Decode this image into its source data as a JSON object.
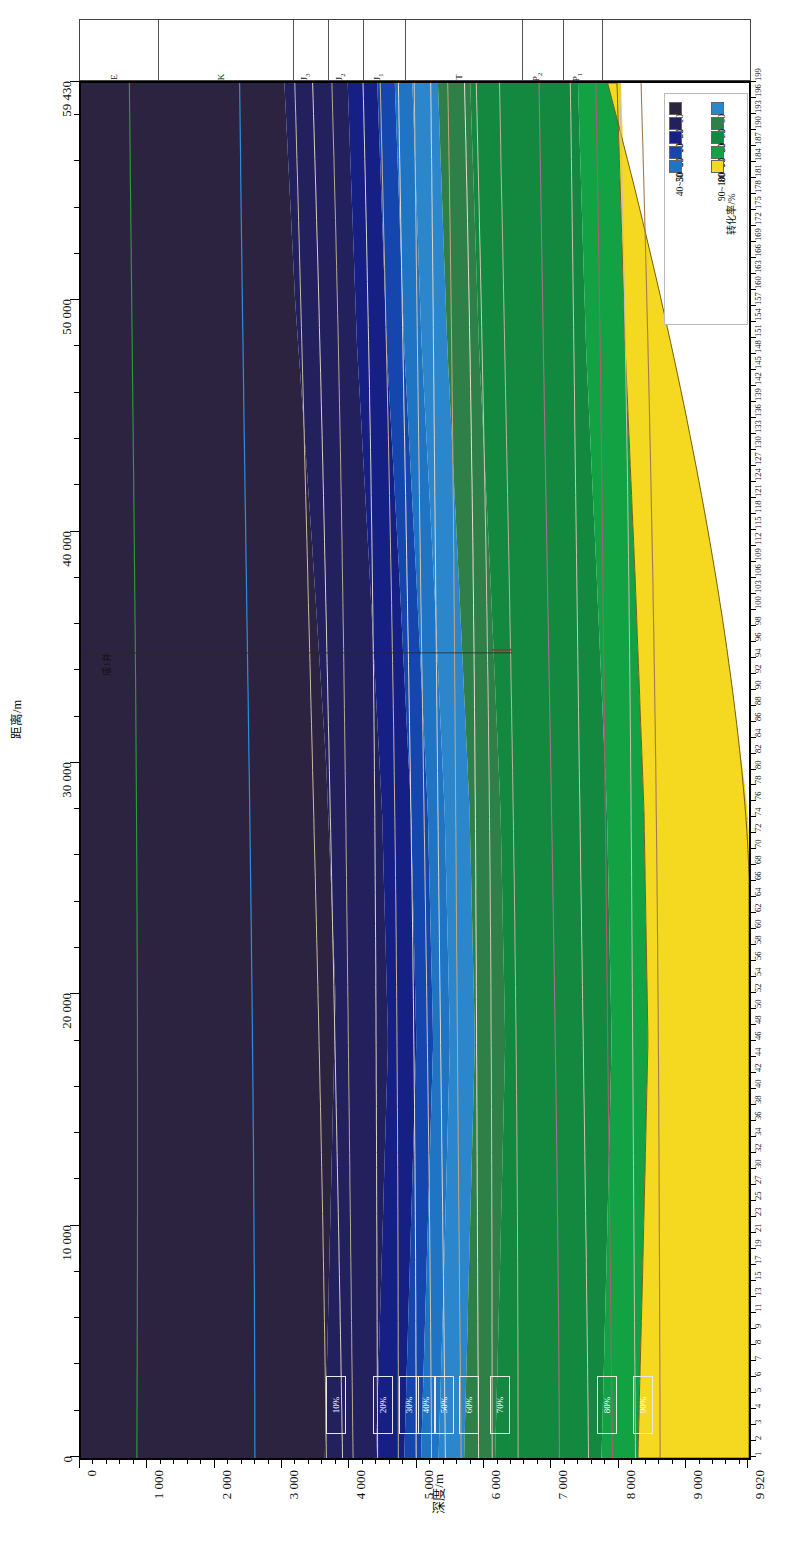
{
  "figure": {
    "type": "geological-cross-section-contour",
    "orientation": "rotated-90-ccw"
  },
  "axes": {
    "distance": {
      "title": "距离/m",
      "unit": "m",
      "min": 0,
      "max": 59430,
      "ticks": [
        {
          "value": 0,
          "label": "0"
        },
        {
          "value": 10000,
          "label": "10 000"
        },
        {
          "value": 20000,
          "label": "20 000"
        },
        {
          "value": 30000,
          "label": "30 000"
        },
        {
          "value": 40000,
          "label": "40 000"
        },
        {
          "value": 50000,
          "label": "50 000"
        },
        {
          "value": 59430,
          "label": "59 430"
        }
      ],
      "minor_step": 2000
    },
    "depth": {
      "title": "深度/m",
      "unit": "m",
      "min": 0,
      "max": 9920,
      "ticks": [
        {
          "value": 0,
          "label": "0"
        },
        {
          "value": 1000,
          "label": "1 000"
        },
        {
          "value": 2000,
          "label": "2 000"
        },
        {
          "value": 3000,
          "label": "3 000"
        },
        {
          "value": 4000,
          "label": "4 000"
        },
        {
          "value": 5000,
          "label": "5 000"
        },
        {
          "value": 6000,
          "label": "6 000"
        },
        {
          "value": 7000,
          "label": "7 000"
        },
        {
          "value": 8000,
          "label": "8 000"
        },
        {
          "value": 9000,
          "label": "9 000"
        },
        {
          "value": 9920,
          "label": "9 920"
        }
      ],
      "minor_step": 200
    },
    "grid_index": {
      "labels": [
        "1",
        "2",
        "3",
        "4",
        "5",
        "6",
        "7",
        "8",
        "9",
        "11",
        "13",
        "15",
        "17",
        "19",
        "21",
        "23",
        "25",
        "27",
        "30",
        "32",
        "34",
        "36",
        "38",
        "40",
        "42",
        "44",
        "46",
        "48",
        "50",
        "52",
        "54",
        "56",
        "58",
        "60",
        "62",
        "64",
        "66",
        "68",
        "70",
        "72",
        "74",
        "76",
        "78",
        "80",
        "82",
        "84",
        "86",
        "88",
        "90",
        "92",
        "94",
        "96",
        "98",
        "100",
        "103",
        "106",
        "109",
        "112",
        "115",
        "118",
        "121",
        "124",
        "127",
        "130",
        "133",
        "136",
        "139",
        "142",
        "145",
        "148",
        "151",
        "154",
        "157",
        "160",
        "163",
        "166",
        "169",
        "172",
        "175",
        "178",
        "181",
        "184",
        "187",
        "190",
        "193",
        "196",
        "199"
      ]
    }
  },
  "strata": {
    "columns": [
      {
        "label": "E",
        "sub": "",
        "width_frac": 0.118
      },
      {
        "label": "K",
        "sub": "",
        "width_frac": 0.202
      },
      {
        "label": "J",
        "sub": "3",
        "width_frac": 0.052
      },
      {
        "label": "J",
        "sub": "2",
        "width_frac": 0.052
      },
      {
        "label": "J",
        "sub": "1",
        "width_frac": 0.062
      },
      {
        "label": "T",
        "sub": "",
        "width_frac": 0.175
      },
      {
        "label": "P",
        "sub": "2",
        "width_frac": 0.062
      },
      {
        "label": "P",
        "sub": "1",
        "width_frac": 0.058
      },
      {
        "label": "",
        "sub": "",
        "width_frac": 0.219
      }
    ]
  },
  "legend": {
    "title": "转化率/%",
    "lower": [
      {
        "label": "0~10",
        "color": "#2b2340"
      },
      {
        "label": "10~20",
        "color": "#22215e"
      },
      {
        "label": "20~30",
        "color": "#151f84"
      },
      {
        "label": "30~40",
        "color": "#1546ad"
      },
      {
        "label": "40~50",
        "color": "#1f74c4"
      }
    ],
    "upper": [
      {
        "label": "50~60",
        "color": "#2b86cc"
      },
      {
        "label": "60~70",
        "color": "#2f7f49"
      },
      {
        "label": "70~80",
        "color": "#12893f"
      },
      {
        "label": "80~90",
        "color": "#12a244"
      },
      {
        "label": "90~100",
        "color": "#f5d820"
      }
    ]
  },
  "contour_labels": [
    {
      "text": "10%",
      "depth": 3740,
      "distance": 2400
    },
    {
      "text": "20%",
      "depth": 4440,
      "distance": 2400
    },
    {
      "text": "30%",
      "depth": 4830,
      "distance": 2400
    },
    {
      "text": "40%",
      "depth": 5080,
      "distance": 2400
    },
    {
      "text": "50%",
      "depth": 5340,
      "distance": 2400
    },
    {
      "text": "60%",
      "depth": 5720,
      "distance": 2400
    },
    {
      "text": "70%",
      "depth": 6180,
      "distance": 2400
    },
    {
      "text": "80%",
      "depth": 7760,
      "distance": 2400
    },
    {
      "text": "90%",
      "depth": 8300,
      "distance": 2400
    }
  ],
  "annotations": [
    {
      "name": "well-label",
      "text": "成1井",
      "depth": 230,
      "distance": 34800
    }
  ],
  "chart_data": {
    "type": "heatmap",
    "title": "",
    "xlabel": "深度/m",
    "ylabel": "距离/m",
    "xlim": [
      0,
      9920
    ],
    "ylim": [
      0,
      59430
    ],
    "grid": false,
    "legend_position": "top-right",
    "legend_title": "转化率/%",
    "bins": [
      "0~10",
      "10~20",
      "20~30",
      "30~40",
      "40~50",
      "50~60",
      "60~70",
      "70~80",
      "80~90",
      "90~100"
    ],
    "bin_colors": [
      "#2b2340",
      "#22215e",
      "#151f84",
      "#1546ad",
      "#1f74c4",
      "#2b86cc",
      "#2f7f49",
      "#12893f",
      "#12a244",
      "#f5d820"
    ],
    "contours": [
      {
        "level": "10%",
        "points": [
          [
            3620,
            0
          ],
          [
            3700,
            10000
          ],
          [
            3780,
            20000
          ],
          [
            3640,
            30000
          ],
          [
            3420,
            40000
          ],
          [
            3180,
            50000
          ],
          [
            3020,
            59430
          ]
        ]
      },
      {
        "level": "20%",
        "points": [
          [
            4380,
            0
          ],
          [
            4460,
            8000
          ],
          [
            4560,
            18000
          ],
          [
            4470,
            28000
          ],
          [
            4290,
            38000
          ],
          [
            4100,
            48000
          ],
          [
            3960,
            59430
          ]
        ]
      },
      {
        "level": "30%",
        "points": [
          [
            4800,
            0
          ],
          [
            4880,
            8000
          ],
          [
            4980,
            18000
          ],
          [
            4900,
            28000
          ],
          [
            4730,
            38000
          ],
          [
            4540,
            48000
          ],
          [
            4400,
            59430
          ]
        ]
      },
      {
        "level": "40%",
        "points": [
          [
            5050,
            0
          ],
          [
            5130,
            8000
          ],
          [
            5230,
            18000
          ],
          [
            5150,
            28000
          ],
          [
            4980,
            38000
          ],
          [
            4800,
            48000
          ],
          [
            4660,
            59430
          ]
        ]
      },
      {
        "level": "50%",
        "points": [
          [
            5310,
            0
          ],
          [
            5390,
            8000
          ],
          [
            5480,
            18000
          ],
          [
            5400,
            28000
          ],
          [
            5240,
            38000
          ],
          [
            5060,
            48000
          ],
          [
            4920,
            59430
          ]
        ]
      },
      {
        "level": "60%",
        "points": [
          [
            5690,
            0
          ],
          [
            5760,
            8000
          ],
          [
            5850,
            18000
          ],
          [
            5770,
            28000
          ],
          [
            5610,
            38000
          ],
          [
            5440,
            48000
          ],
          [
            5300,
            59430
          ]
        ]
      },
      {
        "level": "70%",
        "points": [
          [
            6150,
            0
          ],
          [
            6220,
            8000
          ],
          [
            6300,
            18000
          ],
          [
            6230,
            28000
          ],
          [
            6080,
            38000
          ],
          [
            5910,
            48000
          ],
          [
            5780,
            59430
          ]
        ]
      },
      {
        "level": "80%",
        "points": [
          [
            7730,
            0
          ],
          [
            7800,
            8000
          ],
          [
            7880,
            18000
          ],
          [
            7810,
            28000
          ],
          [
            7660,
            38000
          ],
          [
            7500,
            48000
          ],
          [
            7380,
            59430
          ]
        ]
      },
      {
        "level": "90%",
        "points": [
          [
            8270,
            0
          ],
          [
            8340,
            8000
          ],
          [
            8420,
            18000
          ],
          [
            8360,
            28000
          ],
          [
            8230,
            38000
          ],
          [
            8080,
            48000
          ],
          [
            7960,
            59430
          ]
        ]
      }
    ]
  }
}
